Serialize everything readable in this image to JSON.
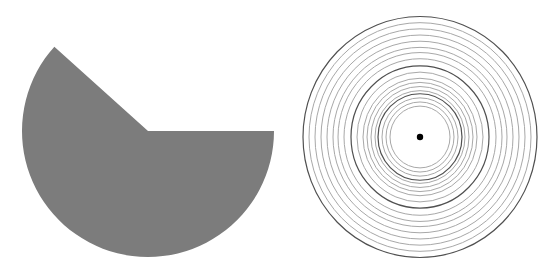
{
  "figures": [
    {
      "id": "sector-shape",
      "type": "circular-sector",
      "fill": "#7c7c7c",
      "center": [
        148,
        131
      ],
      "radius": 126,
      "tip_point": [
        55,
        48
      ],
      "missing_wedge_from_deg": -138,
      "missing_wedge_to_deg": 0
    },
    {
      "id": "concentric-circles",
      "type": "concentric-rings",
      "center": [
        420,
        137
      ],
      "x_scale": 1.0,
      "y_scale": 1.03,
      "stroke_light": "#a8a8a8",
      "stroke_dark": "#505050",
      "center_dot_color": "#000000",
      "center_dot_radius": 3.2,
      "rings": [
        {
          "r": 117,
          "dark": true
        },
        {
          "r": 111,
          "dark": false
        },
        {
          "r": 105,
          "dark": false
        },
        {
          "r": 99,
          "dark": false
        },
        {
          "r": 93,
          "dark": false
        },
        {
          "r": 87,
          "dark": false
        },
        {
          "r": 82,
          "dark": false
        },
        {
          "r": 76,
          "dark": false
        },
        {
          "r": 69,
          "dark": true
        },
        {
          "r": 63,
          "dark": false
        },
        {
          "r": 57,
          "dark": false
        },
        {
          "r": 53,
          "dark": false
        },
        {
          "r": 49,
          "dark": false
        },
        {
          "r": 45,
          "dark": false
        },
        {
          "r": 42,
          "dark": true
        },
        {
          "r": 38,
          "dark": false
        },
        {
          "r": 34,
          "dark": false
        },
        {
          "r": 30,
          "dark": false
        }
      ]
    }
  ]
}
